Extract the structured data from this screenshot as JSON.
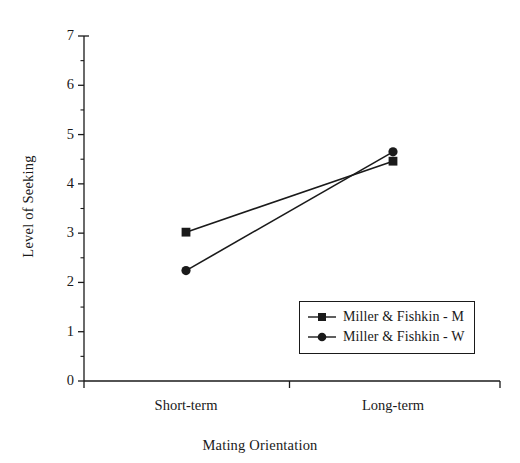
{
  "chart_data": {
    "type": "line",
    "title": "",
    "xlabel": "Mating Orientation",
    "ylabel": "Level of Seeking",
    "categories": [
      "Short-term",
      "Long-term"
    ],
    "ylim": [
      0,
      7
    ],
    "ytick_labels": [
      "0",
      "1",
      "2",
      "3",
      "4",
      "5",
      "6",
      "7"
    ],
    "ytick_values": [
      0,
      1,
      2,
      3,
      4,
      5,
      6,
      7
    ],
    "yminor_values": [
      0.5,
      1.5,
      2.5,
      3.5,
      4.5,
      5.5,
      6.5
    ],
    "grid": false,
    "legend_position": "lower right",
    "series": [
      {
        "name": "Miller & Fishkin - M",
        "marker": "square",
        "color": "#1a1a1a",
        "values": [
          3.02,
          4.46
        ]
      },
      {
        "name": "Miller & Fishkin - W",
        "marker": "circle",
        "color": "#1a1a1a",
        "values": [
          2.24,
          4.65
        ]
      }
    ]
  },
  "axes": {
    "y_axis_name": "level-of-seeking-axis",
    "x_axis_name": "mating-orientation-axis"
  },
  "legend": {
    "entries": [
      {
        "label": "Miller & Fishkin - M",
        "marker": "square"
      },
      {
        "label": "Miller & Fishkin - W",
        "marker": "circle"
      }
    ]
  }
}
